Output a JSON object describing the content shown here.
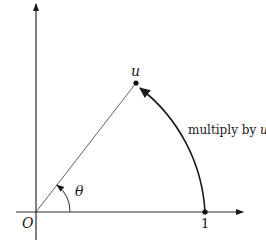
{
  "diagram": {
    "labels": {
      "origin": "O",
      "unit_point": "1",
      "u_point": "u",
      "angle": "θ",
      "arc_caption_prefix": "multiply by ",
      "arc_caption_var": "u"
    },
    "colors": {
      "stroke": "#1a1a1a",
      "axis": "#2a2a2a",
      "background": "#ffffff"
    }
  }
}
